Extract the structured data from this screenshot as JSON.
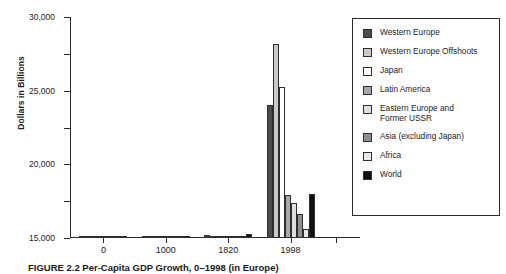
{
  "chart_data": {
    "type": "bar",
    "title": "",
    "xlabel": "",
    "ylabel": "Dollars in Billions",
    "categories": [
      "0",
      "1000",
      "1820",
      "1998"
    ],
    "ylim": [
      0,
      30000
    ],
    "yticks": [
      0,
      5000,
      10000,
      15000,
      20000,
      25000,
      30000
    ],
    "ytick_labels": [
      "0",
      "5,000",
      "10,000",
      "15,000",
      "20,000",
      "25,000",
      "30,000"
    ],
    "grid": false,
    "legend_position": "right",
    "series": [
      {
        "name": "Western Europe",
        "color": "#4a4a4a",
        "values": [
          160,
          180,
          420,
          18000
        ]
      },
      {
        "name": "Western Europe Offshoots",
        "color": "#c9c9c9",
        "values": [
          90,
          95,
          260,
          26300
        ]
      },
      {
        "name": "Japan",
        "color": "#ffffff",
        "values": [
          70,
          80,
          200,
          20500
        ]
      },
      {
        "name": "Latin America",
        "color": "#a8a8a8",
        "values": [
          110,
          120,
          180,
          5800
        ]
      },
      {
        "name": "Eastern Europe and\nFormer USSR",
        "color": "#dedede",
        "values": [
          90,
          100,
          220,
          4700
        ]
      },
      {
        "name": "Asia (excluding Japan)",
        "color": "#8f8f8f",
        "values": [
          130,
          150,
          300,
          3200
        ]
      },
      {
        "name": "Africa",
        "color": "#e8e8e8",
        "values": [
          80,
          90,
          140,
          1200
        ]
      },
      {
        "name": "World",
        "color": "#111111",
        "values": [
          180,
          200,
          500,
          6000
        ]
      }
    ]
  },
  "caption": "FIGURE 2.2  Per-Capita GDP Growth, 0–1998 (in Europe)"
}
